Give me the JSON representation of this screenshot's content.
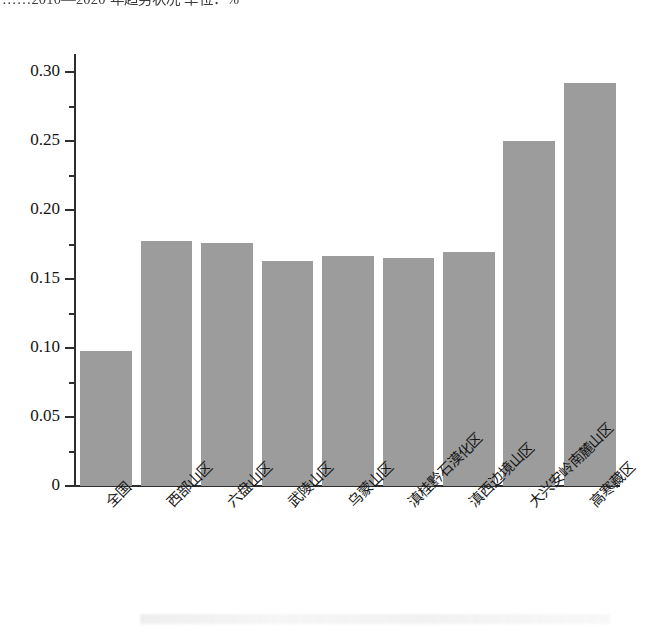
{
  "caption": {
    "text": "……2010—2020 年趋势状况  单位：%"
  },
  "chart_data": {
    "type": "bar",
    "title": "",
    "subtitle": "",
    "xlabel": "",
    "ylabel": "",
    "categories": [
      "全国",
      "西部山区",
      "六盘山区",
      "武陵山区",
      "乌蒙山区",
      "滇桂黔石漠化区",
      "滇西边境山区",
      "大兴安岭南麓山区",
      "高寒藏区"
    ],
    "values": [
      0.098,
      0.178,
      0.176,
      0.163,
      0.167,
      0.165,
      0.17,
      0.25,
      0.292
    ],
    "ylim": [
      0,
      0.3125
    ],
    "ytick_values": [
      0,
      0.05,
      0.1,
      0.15,
      0.2,
      0.25,
      0.3
    ],
    "ytick_labels": [
      "0",
      "0.05",
      "0.10",
      "0.15",
      "0.20",
      "0.25",
      "0.30"
    ],
    "yminor_values": [
      0.025,
      0.075,
      0.125,
      0.175,
      0.225,
      0.275
    ],
    "grid": false,
    "legend": null,
    "bar_color": "#9c9c9c",
    "axis_color": "#2e2e2e",
    "label_rotation": -45
  }
}
